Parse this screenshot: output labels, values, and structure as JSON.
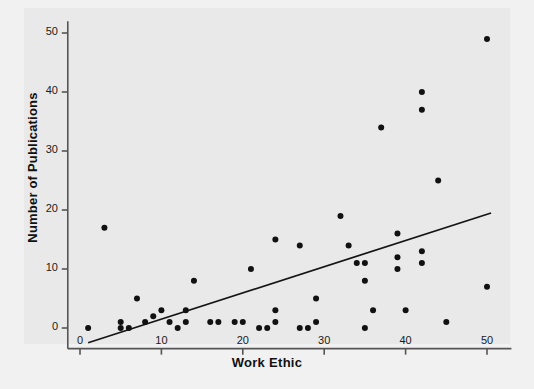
{
  "chart_data": {
    "type": "scatter",
    "title": "",
    "xlabel": "Work Ethic",
    "ylabel": "Number of Publications",
    "xlim": [
      -1.5,
      53
    ],
    "ylim": [
      -3.5,
      52
    ],
    "xticks": [
      0,
      10,
      20,
      30,
      40,
      50
    ],
    "yticks": [
      0,
      10,
      20,
      30,
      40,
      50
    ],
    "grid": false,
    "legend": null,
    "marker": "filled-circle",
    "marker_color": "#111111",
    "background_color": "#e9e9e9",
    "page_background_color": "#f1f1f1",
    "axis_color": "#555555",
    "points": [
      [
        1,
        0
      ],
      [
        3,
        17
      ],
      [
        5,
        1
      ],
      [
        5,
        0
      ],
      [
        6,
        0
      ],
      [
        7,
        5
      ],
      [
        8,
        1
      ],
      [
        9,
        2
      ],
      [
        10,
        3
      ],
      [
        11,
        1
      ],
      [
        12,
        0
      ],
      [
        13,
        3
      ],
      [
        13,
        1
      ],
      [
        14,
        8
      ],
      [
        16,
        1
      ],
      [
        17,
        1
      ],
      [
        19,
        1
      ],
      [
        20,
        1
      ],
      [
        21,
        10
      ],
      [
        22,
        0
      ],
      [
        23,
        0
      ],
      [
        24,
        15
      ],
      [
        24,
        3
      ],
      [
        24,
        1
      ],
      [
        27,
        14
      ],
      [
        27,
        0
      ],
      [
        28,
        0
      ],
      [
        29,
        5
      ],
      [
        29,
        1
      ],
      [
        32,
        19
      ],
      [
        33,
        14
      ],
      [
        34,
        11
      ],
      [
        35,
        11
      ],
      [
        35,
        8
      ],
      [
        35,
        0
      ],
      [
        36,
        3
      ],
      [
        37,
        34
      ],
      [
        39,
        16
      ],
      [
        39,
        12
      ],
      [
        39,
        10
      ],
      [
        40,
        3
      ],
      [
        42,
        40
      ],
      [
        42,
        37
      ],
      [
        42,
        13
      ],
      [
        42,
        11
      ],
      [
        44,
        25
      ],
      [
        45,
        1
      ],
      [
        50,
        49
      ],
      [
        50,
        7
      ]
    ],
    "fit_line": {
      "type": "linear-regression",
      "x_start": 1.0,
      "y_start": -2.5,
      "x_end": 50.5,
      "y_end": 19.5
    }
  },
  "axis": {
    "x_tick_labels": [
      "0",
      "10",
      "20",
      "30",
      "40",
      "50"
    ],
    "y_tick_labels": [
      "0",
      "10",
      "20",
      "30",
      "40",
      "50"
    ]
  }
}
